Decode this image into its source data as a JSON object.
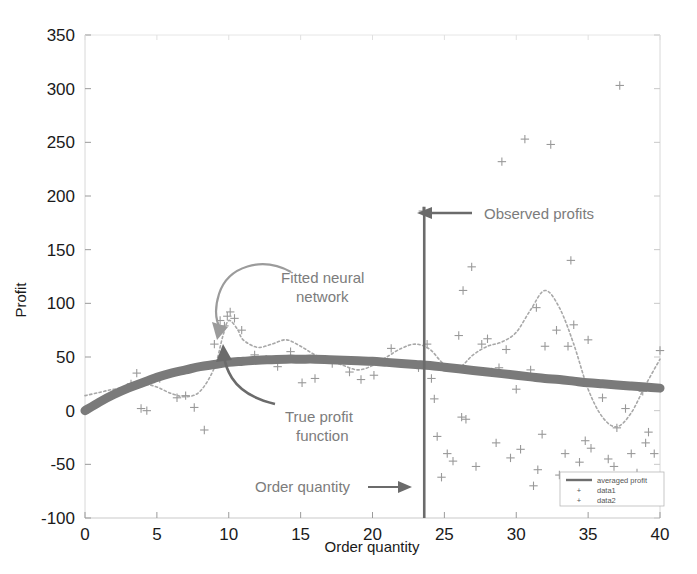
{
  "chart_data": {
    "type": "scatter",
    "title": "",
    "xlabel": "Order quantity",
    "ylabel": "Profit",
    "xlim": [
      0,
      40
    ],
    "ylim": [
      -100,
      350
    ],
    "xticks": [
      0,
      5,
      10,
      15,
      20,
      25,
      30,
      35,
      40
    ],
    "yticks": [
      -100,
      -50,
      0,
      50,
      100,
      150,
      200,
      250,
      300,
      350
    ],
    "grid": false,
    "legend_position": "lower right",
    "legend_entries": [
      {
        "label": "averaged profit",
        "marker": "line",
        "color": "#6e6e6e"
      },
      {
        "label": "data1",
        "marker": "plus",
        "color": "#9a9a9a"
      },
      {
        "label": "data2",
        "marker": "plus",
        "color": "#9a9a9a"
      }
    ],
    "series": [
      {
        "name": "averaged profit",
        "type": "line",
        "style": "thick-solid",
        "color": "#7a7a7a",
        "comment": "True profit function: smooth concave curve",
        "x": [
          0,
          1,
          2,
          3,
          4,
          5,
          6,
          7,
          8,
          9,
          10,
          11,
          12,
          13,
          14,
          15,
          16,
          17,
          18,
          19,
          20,
          21,
          22,
          23,
          24,
          25,
          26,
          27,
          28,
          29,
          30,
          31,
          32,
          33,
          34,
          35,
          36,
          37,
          38,
          39,
          40
        ],
        "y": [
          0,
          8,
          15,
          21,
          26,
          31,
          35,
          38,
          41,
          43,
          45,
          46,
          47,
          47.5,
          48,
          48,
          48,
          47.5,
          47,
          46.5,
          46,
          45,
          44,
          43,
          42,
          40.5,
          39,
          37.5,
          36,
          34.5,
          33,
          31.5,
          30,
          29,
          27.5,
          26,
          25,
          24,
          23,
          22,
          21
        ]
      },
      {
        "name": "fitted neural network",
        "type": "line",
        "style": "dotted",
        "color": "#a8a8a8",
        "comment": "Wiggly overfit curve oscillating around the true function",
        "x": [
          0,
          1,
          2,
          3,
          4,
          5,
          6,
          7,
          8,
          9,
          9.6,
          10,
          10.6,
          11,
          12,
          13,
          14,
          15,
          16,
          17,
          18,
          19,
          20,
          21,
          22,
          23,
          24,
          25,
          26,
          27,
          28,
          29,
          30,
          31,
          32,
          33,
          34,
          35,
          36,
          37,
          38,
          39,
          40
        ],
        "y": [
          14,
          17,
          20,
          22,
          25,
          22,
          16,
          13,
          18,
          40,
          70,
          84,
          76,
          66,
          59,
          62,
          66,
          60,
          52,
          47,
          42,
          38,
          42,
          50,
          58,
          62,
          57,
          43,
          40,
          52,
          60,
          64,
          73,
          94,
          112,
          96,
          62,
          20,
          -6,
          -15,
          -2,
          24,
          48
        ]
      },
      {
        "name": "data1",
        "type": "scatter",
        "marker": "plus",
        "color": "#999999",
        "x": [
          2.0,
          3.2,
          3.6,
          3.9,
          4.3,
          5.2,
          6.4,
          7.0,
          7.6,
          8.3,
          9.0,
          9.4,
          9.7,
          9.9,
          10.1,
          10.4,
          10.9,
          11.8,
          12.6,
          13.4,
          14.3,
          15.1,
          16.0,
          17.2,
          18.4,
          19.2,
          20.1,
          21.3,
          22.0,
          23.2
        ],
        "y": [
          16,
          25,
          35,
          2,
          0,
          30,
          12,
          14,
          3,
          -18,
          62,
          84,
          79,
          88,
          92,
          86,
          75,
          52,
          48,
          41,
          55,
          26,
          30,
          44,
          36,
          29,
          33,
          58,
          44,
          40
        ]
      },
      {
        "name": "data2",
        "type": "scatter",
        "marker": "plus",
        "color": "#999999",
        "x": [
          23.5,
          23.8,
          24.1,
          24.3,
          24.5,
          24.8,
          25.2,
          25.6,
          26.0,
          26.3,
          26.5,
          26.9,
          27.2,
          27.6,
          28.0,
          28.3,
          28.6,
          29.0,
          29.3,
          29.6,
          30.0,
          30.3,
          30.6,
          31.0,
          31.2,
          31.5,
          31.8,
          32.0,
          32.4,
          32.8,
          33.0,
          33.4,
          33.8,
          34.0,
          34.4,
          34.8,
          35.2,
          35.6,
          36.0,
          36.4,
          36.8,
          37.2,
          37.6,
          38.0,
          38.4,
          38.8,
          39.2,
          39.6,
          40.0,
          26.2,
          28.8,
          31.4,
          33.6,
          35.0,
          37.0,
          39.0
        ],
        "y": [
          186,
          62,
          30,
          11,
          -24,
          -62,
          -40,
          -47,
          70,
          112,
          -8,
          134,
          -52,
          62,
          67,
          36,
          -30,
          232,
          57,
          -44,
          20,
          -36,
          253,
          38,
          -70,
          -55,
          -22,
          60,
          248,
          75,
          -60,
          -40,
          140,
          80,
          -48,
          -28,
          -35,
          -63,
          12,
          -45,
          -52,
          303,
          2,
          -40,
          -58,
          18,
          -20,
          -40,
          56,
          -6,
          40,
          96,
          60,
          66,
          -16,
          -30
        ]
      }
    ],
    "annotations": [
      {
        "name": "observed-profits",
        "text": "Observed profits",
        "arrow": "left",
        "x": 25.9,
        "y": 188
      },
      {
        "name": "fitted-neural-network",
        "text": "Fitted neural\nnetwork",
        "arrow": "curved-down-left",
        "x": 15.5,
        "y": 122
      },
      {
        "name": "true-profit-function",
        "text": "True profit\nfunction",
        "arrow": "curved-up-left",
        "x": 14.5,
        "y": -20
      },
      {
        "name": "order-quantity-marker",
        "text": "Order quantity",
        "arrow": "right",
        "x": 13.5,
        "y": -62
      }
    ],
    "vertical_marker": {
      "name": "order-quantity-line",
      "x": 23.6,
      "y_top": 190,
      "y_bottom": -100,
      "color": "#6b6b6b"
    }
  },
  "axes": {
    "ylabel": "Profit",
    "xlabel": "Order quantity",
    "ytick_labels": [
      "350",
      "300",
      "250",
      "200",
      "150",
      "100",
      "50",
      "0",
      "-50",
      "-100"
    ],
    "xtick_labels": [
      "0",
      "5",
      "10",
      "15",
      "20",
      "25",
      "30",
      "35",
      "40"
    ]
  },
  "legend": {
    "items": [
      {
        "label": "averaged profit"
      },
      {
        "label": "data1"
      },
      {
        "label": "data2"
      }
    ]
  },
  "annotations_text": {
    "observed_profits": "Observed profits",
    "fitted_nn_line1": "Fitted neural",
    "fitted_nn_line2": "network",
    "true_profit_line1": "True profit",
    "true_profit_line2": "function",
    "order_quantity": "Order quantity"
  }
}
